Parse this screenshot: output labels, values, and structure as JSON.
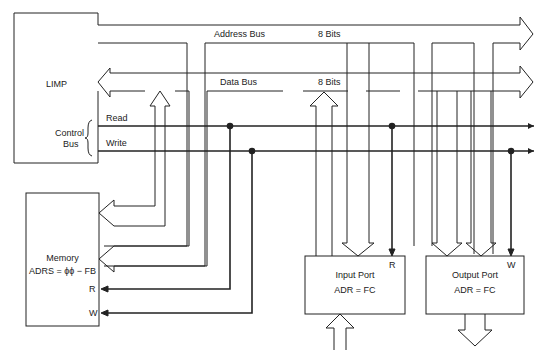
{
  "diagram": {
    "type": "block-diagram",
    "blocks": {
      "limp": {
        "label": "LIMP"
      },
      "memory": {
        "label": "Memory",
        "address": "ADRS = ϕϕ − FB",
        "pin_r": "R",
        "pin_w": "W"
      },
      "input_port": {
        "label": "Input Port",
        "address": "ADR = FC",
        "pin": "R"
      },
      "output_port": {
        "label": "Output Port",
        "address": "ADR = FC",
        "pin": "W"
      }
    },
    "buses": {
      "address": {
        "label": "Address Bus",
        "width": "8 Bits"
      },
      "data": {
        "label": "Data Bus",
        "width": "8 Bits"
      },
      "control": {
        "label_line1": "Control",
        "label_line2": "Bus",
        "read": "Read",
        "write": "Write"
      }
    },
    "colors": {
      "line": "#222222",
      "background": "#ffffff"
    }
  }
}
